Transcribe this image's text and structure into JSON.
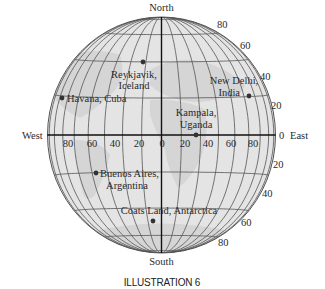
{
  "figure": {
    "caption": "ILLUSTRATION 6",
    "directions": {
      "north": "North",
      "south": "South",
      "west": "West",
      "east": "East",
      "east_zero": "0"
    },
    "latitude_labels_north": [
      "80",
      "60",
      "40",
      "20"
    ],
    "latitude_labels_south": [
      "20",
      "40",
      "60",
      "80"
    ],
    "longitude_labels": [
      "80",
      "60",
      "40",
      "20",
      "0",
      "20",
      "40",
      "60",
      "80"
    ],
    "locations": [
      {
        "name": "reykjavik",
        "line1": "Reykjavik,",
        "line2": "Iceland",
        "lat": 64,
        "lon": -22
      },
      {
        "name": "havana",
        "line1": "Havana, Cuba",
        "line2": "",
        "lat": 23,
        "lon": -82
      },
      {
        "name": "new-delhi",
        "line1": "New Delhi,",
        "line2": "India",
        "lat": 29,
        "lon": 77
      },
      {
        "name": "kampala",
        "line1": "Kampala,",
        "line2": "Uganda",
        "lat": 0,
        "lon": 32
      },
      {
        "name": "buenos-aires",
        "line1": "Buenos Aires,",
        "line2": "Argentina",
        "lat": -35,
        "lon": -58
      },
      {
        "name": "coats-land",
        "line1": "Coats Land, Antarctica",
        "line2": "",
        "lat": -77,
        "lon": -27
      }
    ],
    "colors": {
      "globe_fill": "#e4e4e4",
      "land_fill": "#d2d2d2",
      "grid_line": "#555555",
      "axis_line": "#111111",
      "dot": "#333333"
    }
  }
}
